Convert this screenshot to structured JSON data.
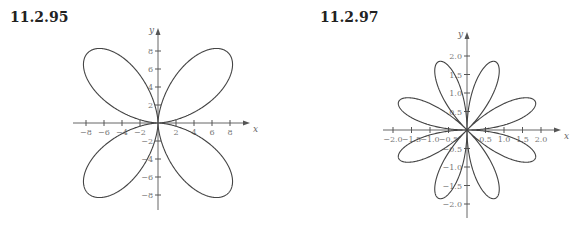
{
  "chart_data": [
    {
      "id": "11.2.95",
      "type": "line",
      "title": "11.2.95",
      "description": "Polar curve: four-leaf figure with petals in each quadrant, pinched toward the axes at the origin",
      "xlabel": "x",
      "ylabel": "y",
      "xlim": [
        -9,
        9
      ],
      "ylim": [
        -9,
        9
      ],
      "xticks": [
        -8,
        -6,
        -4,
        -2,
        2,
        4,
        6,
        8
      ],
      "yticks": [
        -8,
        -6,
        -4,
        -2,
        2,
        4,
        6,
        8
      ],
      "xtick_labels": [
        "−8",
        "−6",
        "−4",
        "−2",
        "2",
        "4",
        "6",
        "8"
      ],
      "ytick_labels": [
        "−8",
        "−6",
        "−4",
        "−2",
        "2",
        "4",
        "6",
        "8"
      ],
      "grid": false,
      "petal_extent": 7.8,
      "petals": 4
    },
    {
      "id": "11.2.97",
      "type": "line",
      "title": "11.2.97",
      "description": "Eight-petal rose curve, petals at 22.5° + k·45°, maximum radius ≈ 2",
      "xlabel": "x",
      "ylabel": "y",
      "xlim": [
        -2.3,
        2.3
      ],
      "ylim": [
        -2.3,
        2.3
      ],
      "xticks": [
        -2.0,
        -1.5,
        -1.0,
        -0.5,
        0.5,
        1.0,
        1.5,
        2.0
      ],
      "yticks": [
        -2.0,
        -1.5,
        -1.0,
        -0.5,
        0.5,
        1.0,
        1.5,
        2.0
      ],
      "xtick_labels": [
        "−2.0",
        "−1.5",
        "−1.0",
        "−0.5",
        "0.5",
        "1.0",
        "1.5",
        "2.0"
      ],
      "ytick_labels": [
        "−2.0",
        "−1.5",
        "−1.0",
        "−0.5",
        "0.5",
        "1.0",
        "1.5",
        "2.0"
      ],
      "grid": false,
      "petal_radius": 2,
      "petals": 8
    }
  ]
}
